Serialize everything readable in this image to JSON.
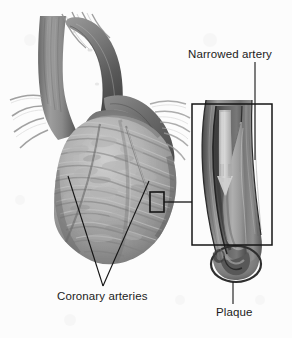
{
  "figure": {
    "background_color": "#fcfcfc",
    "ink_color": "#1b1b1b",
    "style": "grayscale medical line-and-tone illustration"
  },
  "labels": {
    "narrowed_artery": "Narrowed artery",
    "coronary_arteries": "Coronary arteries",
    "plaque": "Plaque"
  },
  "annotations": {
    "callout_box_small": {
      "name": "coronary-artery-detail-marker",
      "x": 150,
      "y": 192,
      "width": 14,
      "height": 20
    },
    "callout_box_large": {
      "name": "magnified-artery-frame",
      "x": 192,
      "y": 104,
      "width": 80,
      "height": 141
    },
    "connector_line": {
      "from_x": 164,
      "from_y": 202,
      "to_x": 192,
      "to_y": 202
    },
    "narrowed_artery_leader": {
      "x": 255,
      "y1": 62,
      "y2": 160
    },
    "plaque_leader": {
      "x": 233,
      "y1": 282,
      "y2": 304
    },
    "coronary_leader_left": {
      "x1": 68,
      "y1": 176,
      "x2": 103,
      "y2": 286
    },
    "coronary_leader_right": {
      "x1": 149,
      "y1": 181,
      "x2": 103,
      "y2": 286
    }
  },
  "anatomy": {
    "heart": {
      "name": "heart-illustration",
      "parts": [
        "superior vena cava",
        "aortic arch",
        "pulmonary artery",
        "left ventricle",
        "right ventricle",
        "epicardial surface"
      ]
    },
    "artery_inset": {
      "name": "narrowed-artery-illustration",
      "parts": [
        "arterial wall",
        "lumen",
        "plaque deposit",
        "blood flow arrow",
        "cut end"
      ]
    }
  },
  "palette": {
    "paper": "#fcfcfc",
    "ink": "#1b1b1b",
    "tone_lightest": "#dedede",
    "tone_light": "#c4c4c4",
    "tone_mid": "#a6a6a6",
    "tone_mid_dark": "#8a8a8a",
    "tone_dark": "#6d6d6d",
    "tone_darker": "#565656",
    "tone_darkest": "#3d3d3d"
  }
}
